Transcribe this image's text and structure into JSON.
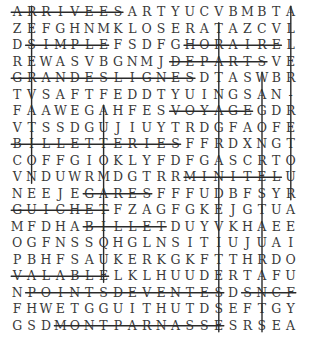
{
  "puzzle": {
    "rows": [
      "ARRIVEESARTYUCVBMBTA",
      "ZEFGHNMKLOSERATAZCVL",
      "DSIMPLEFSDFGHORAIREL",
      "REWASVBGNMJDEPARTSVE",
      "GRANDESLIGNESDTASWBR",
      "TVSAFTFEDDTYUINGSAN-",
      "FAAWEGAHFESVOYAGEGDR",
      "VTSSDGUJIUYTRDGFAOFE",
      "BILLETTERIESFFRDXNGT",
      "COFFGIOKLYFDFGASCRTO",
      "VNDUWRMDGTRRMINITELU",
      "NEEJEGARESFFFUDBFSYR",
      "GUICHETFZAGFGKEJGTUA",
      "MFDHABILLETDUYVKHAEE",
      "OGFNSSQHGLNSITIUJUAI",
      "PBHFSAUKERKGKFTTHRDO",
      "VALABLELKLHUUDERTAFU",
      "NPOINTSDEVENTESDSNCF",
      "FHWETGGUITHUTDSEFTGY",
      "GSDMONTPARNASSESRSEA"
    ],
    "found_words": [
      {
        "word": "ARRIVEES",
        "dir": "h",
        "row": 1,
        "from": 1,
        "to": 8
      },
      {
        "word": "SIMPLE",
        "dir": "h",
        "row": 3,
        "from": 2,
        "to": 7
      },
      {
        "word": "HORAIRE",
        "dir": "h",
        "row": 3,
        "from": 13,
        "to": 19
      },
      {
        "word": "DEPARTS",
        "dir": "h",
        "row": 4,
        "from": 12,
        "to": 18
      },
      {
        "word": "GRANDESLIGNES",
        "dir": "h",
        "row": 5,
        "from": 1,
        "to": 13
      },
      {
        "word": "VOYAGE",
        "dir": "h",
        "row": 7,
        "from": 12,
        "to": 17
      },
      {
        "word": "BILLETTERIES",
        "dir": "h",
        "row": 9,
        "from": 1,
        "to": 12
      },
      {
        "word": "MINITEL",
        "dir": "h",
        "row": 11,
        "from": 13,
        "to": 19
      },
      {
        "word": "GARES",
        "dir": "h",
        "row": 12,
        "from": 6,
        "to": 10
      },
      {
        "word": "GUICHET",
        "dir": "h",
        "row": 13,
        "from": 1,
        "to": 7
      },
      {
        "word": "BILLET",
        "dir": "h",
        "row": 14,
        "from": 6,
        "to": 11
      },
      {
        "word": "VALABLE",
        "dir": "h",
        "row": 17,
        "from": 1,
        "to": 7
      },
      {
        "word": "POINTSDEVENTES",
        "dir": "h",
        "row": 18,
        "from": 2,
        "to": 15
      },
      {
        "word": "SNCF",
        "dir": "h",
        "row": 18,
        "from": 17,
        "to": 20
      },
      {
        "word": "MONTPARNASSE",
        "dir": "h",
        "row": 20,
        "from": 4,
        "to": 15
      },
      {
        "word": "RESERVATION",
        "dir": "v",
        "col": 2,
        "from": 1,
        "to": 11
      },
      {
        "word": "AUTOMATIQUE",
        "dir": "v",
        "col": 7,
        "from": 7,
        "to": 17
      },
      {
        "word": "TRAINAGRANDEVITESSE",
        "dir": "v",
        "col": 15,
        "from": 2,
        "to": 20
      },
      {
        "word": "WAGONRESTAURANTS",
        "dir": "v",
        "col": 18,
        "from": 5,
        "to": 20
      },
      {
        "word": "ALLER-RETOUR",
        "dir": "v",
        "col": 20,
        "from": 1,
        "to": 12
      }
    ]
  }
}
